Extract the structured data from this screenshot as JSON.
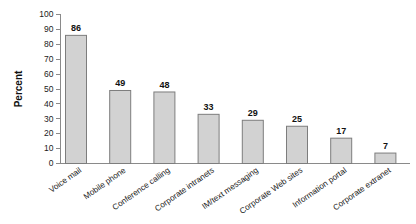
{
  "chart_data": {
    "type": "bar",
    "title": "",
    "subtitle": "",
    "xlabel": "",
    "ylabel": "Percent",
    "ylim": [
      0,
      100
    ],
    "ytick_step": 10,
    "yticks": [
      0,
      10,
      20,
      30,
      40,
      50,
      60,
      70,
      80,
      90,
      100
    ],
    "grid": false,
    "legend": false,
    "legend_position": "none",
    "xtick_rotation_degrees": 35,
    "bar_fill_color": "#d2d2d2",
    "bar_edge_color": "#7d7d7d",
    "axis_color": "#8a8a8a",
    "text_color": "#111111",
    "background_color": "#ffffff",
    "categories": [
      "Voice mail",
      "Mobile phone",
      "Conference calling",
      "Corporate intranets",
      "IM/text messaging",
      "Corporate Web sites",
      "Information portal",
      "Corporate extranet"
    ],
    "values": [
      86,
      49,
      48,
      33,
      29,
      25,
      17,
      7
    ],
    "value_labels": [
      "86",
      "49",
      "48",
      "33",
      "29",
      "25",
      "17",
      "7"
    ],
    "ytick_labels": [
      "0",
      "10",
      "20",
      "30",
      "40",
      "50",
      "60",
      "70",
      "80",
      "90",
      "100"
    ]
  }
}
